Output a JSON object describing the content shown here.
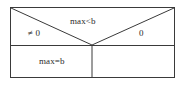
{
  "figure": {
    "kind": "case-partition-box-diagram",
    "background_color": "#ffffff",
    "stroke_color": "#3a3a3a",
    "text_color": "#2b2b2b"
  },
  "frame": {
    "left": 10,
    "top": 7,
    "right": 175,
    "bottom": 78,
    "divider_y": 45,
    "vertex_x": 92,
    "vertical_divider_x": 92
  },
  "regions": {
    "upper_left": {
      "name": "upper-left-region",
      "label": "≠ 0"
    },
    "upper_middle": {
      "name": "upper-middle-region",
      "label": "max<b"
    },
    "upper_right": {
      "name": "upper-right-region",
      "label": "0"
    },
    "lower_left": {
      "name": "lower-left-region",
      "label": "max=b"
    },
    "lower_right": {
      "name": "lower-right-region",
      "label": ""
    }
  },
  "lines": {
    "diagonal_left": "top-left corner to center vertex",
    "diagonal_right": "top-right corner to center vertex",
    "horizontal_divider": "left border to right border at mid height",
    "vertical_divider": "center vertex down to bottom border"
  }
}
